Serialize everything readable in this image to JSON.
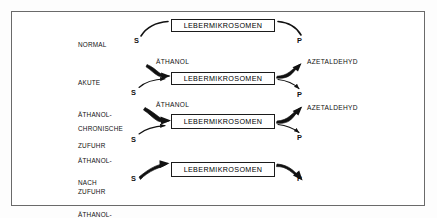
{
  "figure": {
    "type": "biochemical-pathway-diagram",
    "language": "de",
    "frame_border_color": "#6a6a6a",
    "ink_color": "#111111",
    "background": "#ffffff",
    "box_label": "LEBERMIKROSOMEN",
    "substrate_label": "S",
    "product_label": "P",
    "ethanol_label": "ÄTHANOL",
    "acetaldehyde_label": "AZETALDEHYD",
    "rows": [
      {
        "id": "normal",
        "condition_lines": [
          "NORMAL"
        ],
        "box": "LEBERMIKROSOMEN",
        "inputs": [
          {
            "label": "S",
            "weight": "thin"
          }
        ],
        "outputs": [
          {
            "label": "P",
            "weight": "thin"
          }
        ]
      },
      {
        "id": "akute-aethanol-zufuhr",
        "condition_lines": [
          "AKUTE",
          "ÄTHANOL-",
          "ZUFUHR"
        ],
        "box": "LEBERMIKROSOMEN",
        "inputs": [
          {
            "label": "ÄTHANOL",
            "weight": "thick"
          },
          {
            "label": "S",
            "weight": "thin"
          }
        ],
        "outputs": [
          {
            "label": "AZETALDEHYD",
            "weight": "thick"
          },
          {
            "label": "P",
            "weight": "thin"
          }
        ]
      },
      {
        "id": "chronische-aethanol-zufuhr",
        "condition_lines": [
          "CHRONISCHE",
          "ÄTHANOL-",
          "ZUFUHR"
        ],
        "box": "LEBERMIKROSOMEN",
        "inputs": [
          {
            "label": "ÄTHANOL",
            "weight": "thick"
          },
          {
            "label": "S",
            "weight": "thin"
          }
        ],
        "outputs": [
          {
            "label": "AZETALDEHYD",
            "weight": "thick"
          },
          {
            "label": "P",
            "weight": "thin"
          }
        ]
      },
      {
        "id": "nach-aethanol-entzug",
        "condition_lines": [
          "NACH",
          "ÄTHANOL-",
          "ENTZUG"
        ],
        "box": "LEBERMIKROSOMEN",
        "inputs": [
          {
            "label": "S",
            "weight": "thick"
          }
        ],
        "outputs": [
          {
            "label": "P",
            "weight": "thick"
          }
        ]
      }
    ]
  }
}
